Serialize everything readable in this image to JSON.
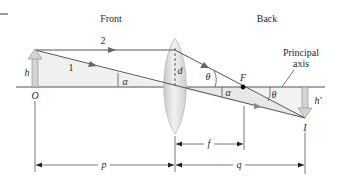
{
  "figure": {
    "region_labels": {
      "front": "Front",
      "back": "Back"
    },
    "ray_labels": {
      "ray1": "1",
      "ray2": "2"
    },
    "object": {
      "height_label": "h",
      "origin_label": "O"
    },
    "lens": {
      "half_height_label": "d"
    },
    "focal_point_label": "F",
    "image": {
      "height_label": "h′",
      "point_label": "I"
    },
    "axis_label_line1": "Principal",
    "axis_label_line2": "axis",
    "angles": {
      "alpha_left": "α",
      "alpha_right": "α",
      "theta_left": "θ",
      "theta_right": "θ"
    },
    "dimensions": {
      "object_distance": "p",
      "focal_length": "f",
      "image_distance": "q"
    }
  },
  "colors": {
    "line": "#555555",
    "ray_fill": "#ebebeb",
    "lens_fill": "#dcdcdc",
    "arrow_fill": "#d0d0d0",
    "text": "#2a2a2a"
  }
}
